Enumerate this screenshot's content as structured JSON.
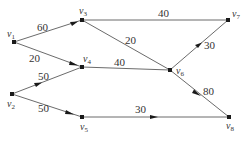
{
  "diagram": {
    "type": "weighted directed graph",
    "nodes": [
      {
        "id": "v1",
        "label": "v",
        "sub": "1",
        "x": 14,
        "y": 42
      },
      {
        "id": "v2",
        "label": "v",
        "sub": "2",
        "x": 12,
        "y": 94
      },
      {
        "id": "v3",
        "label": "v",
        "sub": "3",
        "x": 82,
        "y": 20
      },
      {
        "id": "v4",
        "label": "v",
        "sub": "4",
        "x": 82,
        "y": 67
      },
      {
        "id": "v5",
        "label": "v",
        "sub": "5",
        "x": 82,
        "y": 117
      },
      {
        "id": "v6",
        "label": "v",
        "sub": "6",
        "x": 170,
        "y": 70
      },
      {
        "id": "v7",
        "label": "v",
        "sub": "7",
        "x": 228,
        "y": 20
      },
      {
        "id": "v8",
        "label": "v",
        "sub": "8",
        "x": 229,
        "y": 117
      }
    ],
    "edges": [
      {
        "from": "v1",
        "to": "v3",
        "weight": "60"
      },
      {
        "from": "v1",
        "to": "v4",
        "weight": "20"
      },
      {
        "from": "v2",
        "to": "v4",
        "weight": "50"
      },
      {
        "from": "v2",
        "to": "v5",
        "weight": "50"
      },
      {
        "from": "v3",
        "to": "v7",
        "weight": "40"
      },
      {
        "from": "v3",
        "to": "v6",
        "weight": "20"
      },
      {
        "from": "v4",
        "to": "v6",
        "weight": "40"
      },
      {
        "from": "v6",
        "to": "v7",
        "weight": "30"
      },
      {
        "from": "v6",
        "to": "v8",
        "weight": "80"
      },
      {
        "from": "v5",
        "to": "v8",
        "weight": "30"
      }
    ]
  },
  "labels": {
    "w_v1_v3": "60",
    "w_v1_v4": "20",
    "w_v2_v4": "50",
    "w_v2_v5": "50",
    "w_v3_v7": "40",
    "w_v3_v6": "20",
    "w_v4_v6": "40",
    "w_v6_v7": "30",
    "w_v6_v8": "80",
    "w_v5_v8": "30",
    "v": "v",
    "s1": "1",
    "s2": "2",
    "s3": "3",
    "s4": "4",
    "s5": "5",
    "s6": "6",
    "s7": "7",
    "s8": "8"
  }
}
